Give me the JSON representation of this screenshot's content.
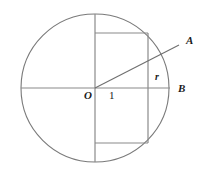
{
  "figure": {
    "kind": "geometry-diagram",
    "background_color": "#ffffff",
    "stroke_color": "#7a7a7a",
    "label_color": "#1a1a1a",
    "labels": [
      {
        "id": "label-A",
        "text": "A",
        "x": 186,
        "y": 44,
        "style": "italic-bold",
        "size": 11
      },
      {
        "id": "label-r",
        "text": "r",
        "x": 155,
        "y": 80,
        "style": "italic-bold",
        "size": 10
      },
      {
        "id": "label-B",
        "text": "B",
        "x": 178,
        "y": 92,
        "style": "italic-bold",
        "size": 11
      },
      {
        "id": "label-O",
        "text": "O",
        "x": 84,
        "y": 99,
        "style": "italic-bold",
        "size": 11
      },
      {
        "id": "label-one",
        "text": "1",
        "x": 109,
        "y": 99,
        "style": "plain",
        "size": 11
      }
    ],
    "circle": {
      "center_x": 95,
      "center_y": 88,
      "radius": 74
    },
    "horizontal_diameter": {
      "x1": 21,
      "y1": 88,
      "x2": 170,
      "y2": 88
    },
    "vertical_diameter": {
      "x1": 95,
      "y1": 14,
      "x2": 95,
      "y2": 162
    },
    "rectangle": {
      "left": 95,
      "right": 148,
      "top": 33,
      "bottom": 143
    },
    "radius_segment": {
      "x1": 95,
      "y1": 88,
      "x2": 179,
      "y2": 45
    }
  }
}
